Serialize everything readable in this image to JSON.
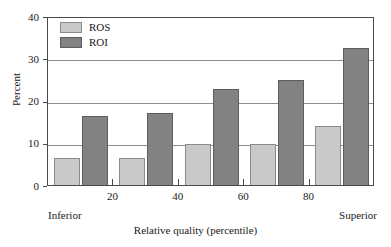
{
  "chart_data": {
    "type": "bar",
    "title": "",
    "xlabel": "Relative quality (percentile)",
    "ylabel": "Percent",
    "categories": [
      "10",
      "30",
      "50",
      "70",
      "90"
    ],
    "series": [
      {
        "name": "ROS",
        "color": "#c9c9c9",
        "values": [
          6.5,
          6.5,
          9.6,
          9.7,
          13.9
        ]
      },
      {
        "name": "ROI",
        "color": "#828282",
        "values": [
          16.3,
          17.0,
          22.7,
          24.9,
          32.5
        ]
      }
    ],
    "ylim": [
      0,
      40
    ],
    "yticks": [
      0,
      10,
      20,
      30,
      40
    ],
    "ytick_labels": [
      "0",
      "10",
      "20",
      "30",
      "40"
    ],
    "xticks": [
      20,
      40,
      60,
      80
    ],
    "xtick_labels": [
      "20",
      "40",
      "60",
      "80"
    ],
    "xlim": [
      0,
      100
    ],
    "grid": true,
    "grid_axis": "y",
    "legend_position": "top-left",
    "annotations": {
      "x_axis_low_end": "Inferior",
      "x_axis_high_end": "Superior"
    }
  },
  "legend": {
    "items": [
      {
        "label": "ROS"
      },
      {
        "label": "ROI"
      }
    ]
  },
  "axes": {
    "y_title": "Percent",
    "x_title": "Relative quality (percentile)",
    "y_labels": [
      "40",
      "30",
      "20",
      "10",
      "0"
    ],
    "x_labels": [
      "20",
      "40",
      "60",
      "80"
    ],
    "x_left_cap": "Inferior",
    "x_right_cap": "Superior"
  }
}
